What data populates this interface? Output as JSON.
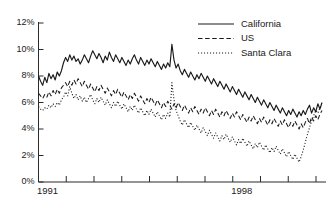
{
  "chart_data": {
    "type": "line",
    "title": "",
    "xlabel": "",
    "ylabel": "",
    "ylim": [
      0,
      12
    ],
    "yticks": [
      0,
      2,
      4,
      6,
      8,
      10,
      12
    ],
    "ytick_labels": [
      "0%",
      "2%",
      "4%",
      "6%",
      "8%",
      "10%",
      "12%"
    ],
    "xlim": [
      1991,
      2001.5
    ],
    "xticks": [
      1991,
      1992,
      1993,
      1994,
      1995,
      1996,
      1997,
      1998,
      1999,
      2000,
      2001
    ],
    "xtick_labels": [
      "1991",
      "",
      "",
      "",
      "",
      "",
      "",
      "1998",
      "",
      "",
      ""
    ],
    "grid": false,
    "legend_position": "top-right",
    "series": [
      {
        "name": "California",
        "style": "solid",
        "color": "#1a1a1a",
        "values": [
          8.0,
          7.6,
          7.3,
          7.9,
          7.5,
          8.2,
          7.8,
          8.1,
          7.7,
          8.3,
          8.0,
          8.4,
          9.0,
          9.4,
          9.1,
          9.6,
          9.2,
          9.5,
          9.1,
          9.3,
          8.9,
          9.2,
          9.6,
          9.3,
          9.0,
          9.5,
          9.9,
          9.6,
          9.3,
          9.7,
          9.4,
          9.0,
          9.5,
          9.2,
          9.8,
          9.4,
          9.1,
          9.6,
          9.3,
          9.0,
          9.4,
          9.1,
          8.8,
          9.2,
          8.9,
          9.3,
          9.6,
          9.2,
          8.9,
          9.4,
          9.1,
          8.8,
          9.2,
          8.9,
          9.3,
          9.0,
          8.7,
          9.1,
          8.8,
          8.5,
          8.9,
          8.6,
          9.0,
          8.7,
          10.4,
          9.2,
          8.6,
          8.9,
          8.4,
          8.1,
          8.5,
          8.2,
          7.9,
          8.3,
          8.0,
          7.7,
          8.1,
          7.8,
          8.2,
          7.9,
          7.6,
          8.0,
          7.7,
          7.4,
          7.8,
          7.5,
          7.2,
          7.6,
          7.3,
          7.0,
          7.4,
          7.1,
          6.8,
          7.2,
          6.9,
          6.6,
          7.0,
          6.7,
          6.4,
          6.8,
          6.5,
          6.2,
          6.6,
          6.3,
          6.0,
          6.4,
          6.1,
          5.8,
          6.2,
          5.9,
          5.6,
          6.0,
          5.7,
          5.4,
          5.8,
          5.5,
          5.2,
          5.6,
          5.3,
          5.0,
          5.4,
          5.1,
          5.5,
          5.2,
          4.9,
          5.3,
          5.0,
          5.4,
          5.1,
          5.5,
          5.8,
          5.2,
          5.6,
          5.3,
          5.9,
          5.5,
          6.0
        ]
      },
      {
        "name": "US",
        "style": "dashed",
        "color": "#1a1a1a",
        "values": [
          6.7,
          6.5,
          6.3,
          6.6,
          6.4,
          6.8,
          6.5,
          6.9,
          6.6,
          7.0,
          6.7,
          7.1,
          7.3,
          7.5,
          7.2,
          7.6,
          7.3,
          7.7,
          7.4,
          7.8,
          7.5,
          7.2,
          7.6,
          7.3,
          7.0,
          7.4,
          7.1,
          6.8,
          7.2,
          6.9,
          7.3,
          7.0,
          6.7,
          7.1,
          6.8,
          6.5,
          6.9,
          6.6,
          7.0,
          6.7,
          6.4,
          6.8,
          6.5,
          6.2,
          6.6,
          6.3,
          6.7,
          6.4,
          6.1,
          6.5,
          6.2,
          5.9,
          6.3,
          6.0,
          6.4,
          6.1,
          5.8,
          6.2,
          5.9,
          5.6,
          6.0,
          5.7,
          6.1,
          5.8,
          5.5,
          5.9,
          5.6,
          6.0,
          5.7,
          5.4,
          5.8,
          5.5,
          5.2,
          5.6,
          5.3,
          5.7,
          5.4,
          5.1,
          5.5,
          5.2,
          5.6,
          5.3,
          5.0,
          5.4,
          5.1,
          5.5,
          5.2,
          4.9,
          5.3,
          5.0,
          5.4,
          5.1,
          4.8,
          5.2,
          4.9,
          5.3,
          5.0,
          4.7,
          5.1,
          4.8,
          4.5,
          4.9,
          4.6,
          5.0,
          4.7,
          4.4,
          4.8,
          4.5,
          4.9,
          4.6,
          4.3,
          4.7,
          4.4,
          4.8,
          4.5,
          4.2,
          4.6,
          4.3,
          4.7,
          4.4,
          4.1,
          4.5,
          4.2,
          4.6,
          4.3,
          4.0,
          4.4,
          4.1,
          4.5,
          4.8,
          4.4,
          4.9,
          4.6,
          5.0,
          4.7,
          5.1,
          5.4
        ]
      },
      {
        "name": "Santa Clara",
        "style": "dotted",
        "color": "#1a1a1a",
        "values": [
          5.7,
          5.5,
          5.4,
          5.6,
          5.5,
          5.8,
          5.6,
          5.9,
          5.7,
          6.0,
          5.8,
          6.2,
          6.4,
          6.8,
          6.5,
          7.2,
          6.7,
          6.3,
          6.6,
          6.2,
          6.5,
          6.1,
          6.4,
          6.0,
          6.3,
          6.6,
          6.2,
          5.9,
          6.3,
          6.0,
          6.4,
          6.1,
          5.8,
          6.2,
          5.9,
          5.6,
          6.0,
          5.7,
          6.1,
          5.8,
          5.5,
          5.9,
          5.6,
          5.3,
          5.7,
          5.4,
          5.8,
          5.5,
          5.2,
          5.6,
          5.3,
          5.0,
          5.4,
          5.1,
          5.5,
          5.2,
          4.9,
          5.3,
          5.0,
          4.7,
          5.1,
          4.8,
          5.2,
          4.9,
          7.5,
          6.2,
          5.4,
          5.0,
          4.6,
          4.3,
          4.7,
          4.4,
          4.1,
          4.5,
          4.2,
          3.9,
          4.3,
          4.0,
          3.7,
          4.1,
          3.8,
          3.5,
          3.9,
          3.6,
          3.3,
          3.7,
          3.4,
          3.1,
          3.5,
          3.2,
          3.6,
          3.3,
          3.0,
          3.4,
          3.1,
          2.8,
          3.2,
          2.9,
          3.3,
          3.0,
          2.7,
          3.1,
          2.8,
          2.5,
          2.9,
          2.6,
          3.0,
          2.7,
          2.4,
          2.8,
          2.5,
          2.2,
          2.6,
          2.3,
          2.7,
          2.4,
          2.1,
          2.5,
          2.2,
          1.9,
          2.3,
          2.0,
          1.7,
          2.1,
          1.8,
          1.5,
          1.9,
          2.4,
          3.0,
          3.6,
          4.1,
          4.6,
          5.0,
          5.4,
          5.2,
          5.6,
          6.0
        ]
      }
    ]
  },
  "legend": {
    "items": [
      {
        "label": "California",
        "style": "solid"
      },
      {
        "label": "US",
        "style": "dashed"
      },
      {
        "label": "Santa Clara",
        "style": "dotted"
      }
    ]
  }
}
